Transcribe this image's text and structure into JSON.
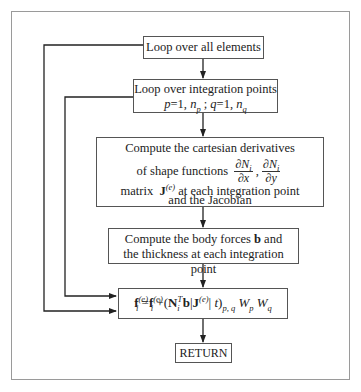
{
  "flowchart": {
    "title": "Element body force vector computation flowchart",
    "boxes": [
      {
        "id": "loop-elements",
        "text": "Loop over all elements"
      },
      {
        "id": "loop-integration",
        "line1": "Loop over integration points",
        "p_eq": "p",
        "p_start": "=1,",
        "np": "n",
        "np_sub": "p",
        "sep": ";",
        "q_eq": "q",
        "q_start": "=1,",
        "nq": "n",
        "nq_sub": "q"
      },
      {
        "id": "compute-derivatives",
        "line1": "Compute the cartesian derivatives",
        "line2_prefix": "of shape functions",
        "frac1_num": "∂N",
        "frac1_num_sub": "i",
        "frac1_den": "∂x",
        "comma": ",",
        "frac2_num": "∂N",
        "frac2_num_sub": "i",
        "frac2_den": "∂y",
        "line2_suffix": "and the Jacobian",
        "line3_prefix": "matrix",
        "jacobian": "J",
        "jacobian_sup": "(e)",
        "line3_suffix": "at each integration point"
      },
      {
        "id": "compute-body-forces",
        "line1_prefix": "Compute the body forces",
        "bold": "b",
        "line1_suffix": "and",
        "line2": "the thickness at each integration point"
      },
      {
        "id": "accumulate",
        "f": "f",
        "f_sub": "i",
        "f_sup": "(e)",
        "eq": "=",
        "f2": "f",
        "f2_sub": "i",
        "f2_sup": "(e)",
        "plus_open": "+(",
        "N": "N",
        "N_sub": "i",
        "N_sup": "T",
        "b": "b",
        "bar1": "|",
        "J": "J",
        "J_sup": "(e)",
        "bar2": "|",
        "t": "t",
        "close": ")",
        "close_sub": "p, q",
        "W1": "W",
        "W1_sub": "p",
        "W2": "W",
        "W2_sub": "q"
      },
      {
        "id": "return",
        "text": "RETURN"
      }
    ],
    "colors": {
      "line": "#222222",
      "box_border": "#555555",
      "frame": "#9a9a9a",
      "background": "#ffffff"
    }
  }
}
